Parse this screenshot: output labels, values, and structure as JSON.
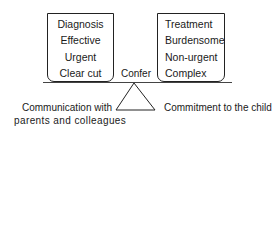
{
  "diagram": {
    "left_box": {
      "items": [
        "Diagnosis",
        "Effective",
        "Urgent",
        "Clear cut"
      ]
    },
    "right_box": {
      "items": [
        "Treatment",
        "Burdensome",
        "Non-urgent",
        "Complex"
      ]
    },
    "center_label": "Confer",
    "fulcrum_left_label": {
      "line1": "Communication with",
      "line2": "parents and colleagues"
    },
    "fulcrum_right_label": "Commitment to the child",
    "colors": {
      "line": "#222222",
      "text": "#1a1a1a",
      "background": "#ffffff"
    }
  }
}
